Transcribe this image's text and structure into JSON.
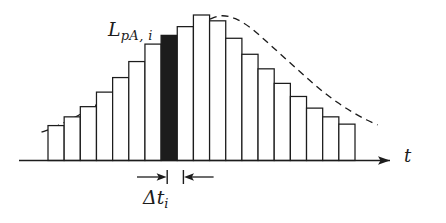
{
  "figure": {
    "kind": "histogram-with-envelope",
    "background_color": "#ffffff",
    "ink_color": "#1c1c1c"
  },
  "labels": {
    "level": {
      "base": "L",
      "sub": "pA, i",
      "full": "L_pA,i"
    },
    "interval": {
      "base": "Δt",
      "sub": "i",
      "full": "Δt_i"
    },
    "axis_t": "t"
  },
  "chart_data": {
    "type": "bar",
    "title": "",
    "xlabel": "t",
    "ylabel": "L_pA,i",
    "grid": false,
    "legend": null,
    "axis_ranges": {
      "x": [
        0,
        20
      ],
      "y": [
        0,
        1.0
      ]
    },
    "bar_count": 19,
    "highlighted_bar_index": 7,
    "highlighted_bar_color": "#1c1c1c",
    "bar_fill_color": "#ffffff",
    "bar_edge_color": "#1c1c1c",
    "categories": [
      "1",
      "2",
      "3",
      "4",
      "5",
      "6",
      "7",
      "8",
      "9",
      "10",
      "11",
      "12",
      "13",
      "14",
      "15",
      "16",
      "17",
      "18",
      "19"
    ],
    "values": [
      0.24,
      0.3,
      0.37,
      0.47,
      0.57,
      0.68,
      0.8,
      0.86,
      0.92,
      1.0,
      0.96,
      0.84,
      0.73,
      0.63,
      0.53,
      0.44,
      0.36,
      0.3,
      0.25
    ],
    "envelope": {
      "type": "line",
      "style": "dashed",
      "color": "#1c1c1c",
      "name": "smooth envelope",
      "x": [
        -0.9,
        -0.4,
        0.2,
        0.9,
        1.7,
        2.6,
        3.5,
        4.4,
        5.3,
        6.2,
        7.1,
        8.0,
        8.9,
        9.6,
        10.3,
        11.1,
        12.0,
        12.9,
        13.8,
        14.7,
        15.6,
        16.5,
        17.4,
        18.3,
        19.2,
        19.9
      ],
      "y": [
        0.195,
        0.215,
        0.245,
        0.282,
        0.33,
        0.39,
        0.455,
        0.525,
        0.6,
        0.68,
        0.77,
        0.855,
        0.93,
        0.975,
        0.995,
        0.975,
        0.915,
        0.83,
        0.74,
        0.65,
        0.56,
        0.475,
        0.4,
        0.335,
        0.28,
        0.245
      ]
    },
    "annotation": {
      "name": "delta-t-dimension",
      "text": "Δt_i",
      "spans_bar_index": 7,
      "arrow_style": "inward-double-arrow-with-extension-ticks"
    }
  }
}
